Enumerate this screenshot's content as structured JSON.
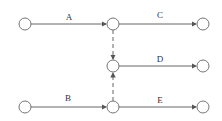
{
  "diagram": {
    "type": "activity-on-arrow network",
    "colors": {
      "line": "#555555",
      "node_stroke": "#666666",
      "node_fill": "#ffffff",
      "text": "#333333"
    },
    "nodes": [
      {
        "id": "n1",
        "x": 25,
        "y": 24
      },
      {
        "id": "n2",
        "x": 113,
        "y": 24
      },
      {
        "id": "n3",
        "x": 203,
        "y": 24
      },
      {
        "id": "n4",
        "x": 113,
        "y": 66
      },
      {
        "id": "n5",
        "x": 203,
        "y": 66
      },
      {
        "id": "n6",
        "x": 25,
        "y": 107
      },
      {
        "id": "n7",
        "x": 113,
        "y": 107
      },
      {
        "id": "n8",
        "x": 203,
        "y": 107
      }
    ],
    "activities": [
      {
        "label": "A",
        "from": "n1",
        "to": "n2",
        "dummy": false
      },
      {
        "label": "C",
        "from": "n2",
        "to": "n3",
        "dummy": false
      },
      {
        "label": "D",
        "from": "n4",
        "to": "n5",
        "dummy": false
      },
      {
        "label": "B",
        "from": "n6",
        "to": "n7",
        "dummy": false
      },
      {
        "label": "E",
        "from": "n7",
        "to": "n8",
        "dummy": false
      },
      {
        "label": "",
        "from": "n2",
        "to": "n4",
        "dummy": true
      },
      {
        "label": "",
        "from": "n7",
        "to": "n4",
        "dummy": true
      }
    ]
  }
}
